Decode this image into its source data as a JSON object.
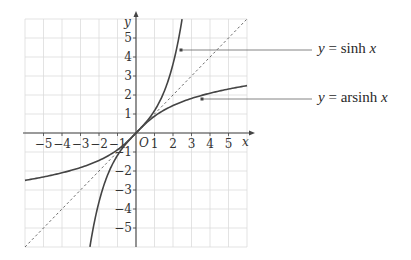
{
  "chart_data": {
    "type": "line",
    "title": "",
    "xlabel": "x",
    "ylabel": "y",
    "origin_label": "O",
    "xlim": [
      -6,
      6
    ],
    "ylim": [
      -6,
      6
    ],
    "grid": true,
    "x_ticks": [
      -5,
      -4,
      -3,
      -2,
      -1,
      1,
      2,
      3,
      4,
      5
    ],
    "y_ticks": [
      -5,
      -4,
      -3,
      -2,
      -1,
      1,
      2,
      3,
      4,
      5
    ],
    "x_tick_labels": [
      "−5",
      "−4",
      "−3",
      "−2",
      "−1",
      "1",
      "2",
      "3",
      "4",
      "5"
    ],
    "y_tick_labels": [
      "−5",
      "−4",
      "−3",
      "−2",
      "−1",
      "1",
      "2",
      "3",
      "4",
      "5"
    ],
    "series": [
      {
        "name": "y = sinh x",
        "style": "solid",
        "function": "sinh",
        "x": [
          -2.49,
          -2,
          -1.5,
          -1,
          -0.5,
          0,
          0.5,
          1,
          1.5,
          2,
          2.49
        ],
        "y": [
          -6.0,
          -3.63,
          -2.13,
          -1.18,
          -0.52,
          0,
          0.52,
          1.18,
          2.13,
          3.63,
          6.0
        ]
      },
      {
        "name": "y = arsinh x",
        "style": "solid",
        "function": "arsinh",
        "x": [
          -6,
          -5,
          -4,
          -3,
          -2,
          -1,
          0,
          1,
          2,
          3,
          4,
          5,
          6
        ],
        "y": [
          -2.49,
          -2.31,
          -2.09,
          -1.82,
          -1.44,
          -0.88,
          0,
          0.88,
          1.44,
          1.82,
          2.09,
          2.31,
          2.49
        ]
      },
      {
        "name": "y = x",
        "style": "dashed",
        "function": "identity",
        "x": [
          -6,
          6
        ],
        "y": [
          -6,
          6
        ]
      }
    ],
    "annotations": [
      {
        "text_parts": [
          "y",
          " = sinh ",
          "x"
        ],
        "points_to": "y = sinh x"
      },
      {
        "text_parts": [
          "y",
          " = arsinh ",
          "x"
        ],
        "points_to": "y = arsinh x"
      }
    ]
  }
}
